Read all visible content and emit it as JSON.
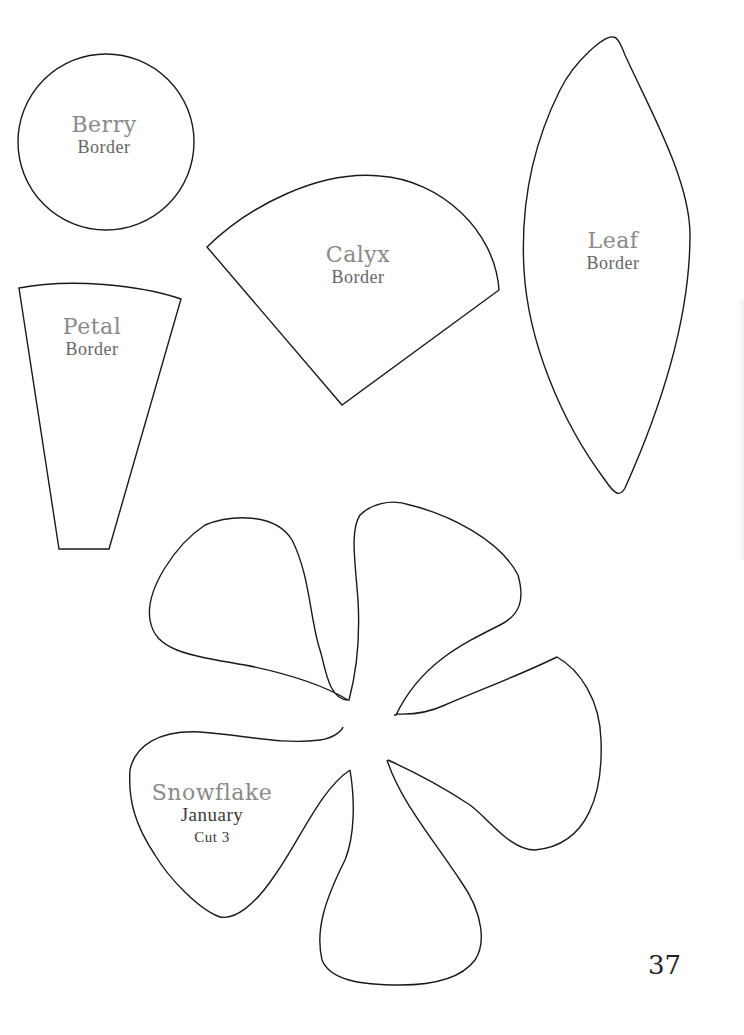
{
  "page": {
    "number": "37",
    "background": "#ffffff",
    "outline_color": "#1a1a1a"
  },
  "templates": {
    "berry": {
      "name": "Berry",
      "subtitle": "Border"
    },
    "calyx": {
      "name": "Calyx",
      "subtitle": "Border"
    },
    "leaf": {
      "name": "Leaf",
      "subtitle": "Border"
    },
    "petal": {
      "name": "Petal",
      "subtitle": "Border"
    },
    "snowflake": {
      "name": "Snowflake",
      "subtitle": "January",
      "instruction": "Cut 3"
    }
  }
}
